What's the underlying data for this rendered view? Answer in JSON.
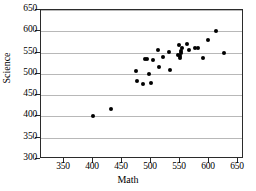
{
  "chart_data": {
    "type": "scatter",
    "title": "",
    "xlabel": "Math",
    "ylabel": "Science",
    "xlim": [
      310,
      660
    ],
    "ylim": [
      300,
      650
    ],
    "xticks": [
      350,
      400,
      450,
      500,
      550,
      600,
      650
    ],
    "yticks": [
      300,
      350,
      400,
      450,
      500,
      550,
      600,
      650
    ],
    "grid": "horizontal",
    "legend": "none",
    "marker": "filled-circle",
    "marker_color": "#000000",
    "points": [
      {
        "x": 400,
        "y": 400
      },
      {
        "x": 430,
        "y": 417
      },
      {
        "x": 474,
        "y": 507
      },
      {
        "x": 476,
        "y": 484
      },
      {
        "x": 486,
        "y": 477
      },
      {
        "x": 489,
        "y": 536
      },
      {
        "x": 493,
        "y": 536
      },
      {
        "x": 497,
        "y": 499
      },
      {
        "x": 500,
        "y": 478
      },
      {
        "x": 503,
        "y": 532
      },
      {
        "x": 512,
        "y": 555
      },
      {
        "x": 513,
        "y": 517
      },
      {
        "x": 520,
        "y": 540
      },
      {
        "x": 531,
        "y": 551
      },
      {
        "x": 533,
        "y": 508
      },
      {
        "x": 546,
        "y": 545
      },
      {
        "x": 548,
        "y": 568
      },
      {
        "x": 549,
        "y": 538
      },
      {
        "x": 550,
        "y": 543
      },
      {
        "x": 551,
        "y": 548
      },
      {
        "x": 552,
        "y": 553
      },
      {
        "x": 553,
        "y": 560
      },
      {
        "x": 562,
        "y": 569
      },
      {
        "x": 566,
        "y": 556
      },
      {
        "x": 575,
        "y": 560
      },
      {
        "x": 580,
        "y": 561
      },
      {
        "x": 589,
        "y": 537
      },
      {
        "x": 598,
        "y": 579
      },
      {
        "x": 611,
        "y": 600
      },
      {
        "x": 625,
        "y": 550
      }
    ]
  }
}
